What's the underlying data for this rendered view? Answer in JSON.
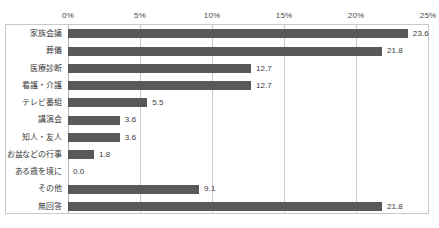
{
  "chart_data": {
    "type": "bar",
    "orientation": "horizontal",
    "title": "",
    "xlabel": "",
    "ylabel": "",
    "xlim": [
      0,
      25
    ],
    "xticks": [
      "0%",
      "5%",
      "10%",
      "15%",
      "20%",
      "25%"
    ],
    "xtick_values": [
      0,
      5,
      10,
      15,
      20,
      25
    ],
    "grid": true,
    "legend": false,
    "bar_color": "#595959",
    "categories": [
      "家族会議",
      "葬儀",
      "医療診断",
      "看護・介護",
      "テレビ番組",
      "講演会",
      "知人・友人",
      "お盆などの行事",
      "ある歳を境に",
      "その他",
      "無回答"
    ],
    "values": [
      23.6,
      21.8,
      12.7,
      12.7,
      5.5,
      3.6,
      3.6,
      1.8,
      0.0,
      9.1,
      21.8
    ],
    "value_labels": [
      "23.6",
      "21.8",
      "12.7",
      "12.7",
      "5.5",
      "3.6",
      "3.6",
      "1.8",
      "0.0",
      "9.1",
      "21.8"
    ]
  }
}
